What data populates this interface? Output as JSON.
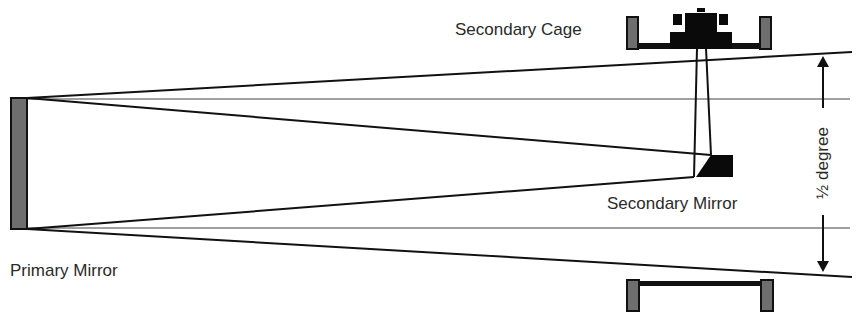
{
  "labels": {
    "secondary_cage": "Secondary Cage",
    "secondary_mirror": "Secondary Mirror",
    "primary_mirror": "Primary Mirror",
    "field_angle": "½  degree"
  },
  "colors": {
    "line": "#111111",
    "axis_gray": "#9a9a9a",
    "mirror_fill": "#6e6e6e",
    "solid": "#0a0a0a"
  }
}
